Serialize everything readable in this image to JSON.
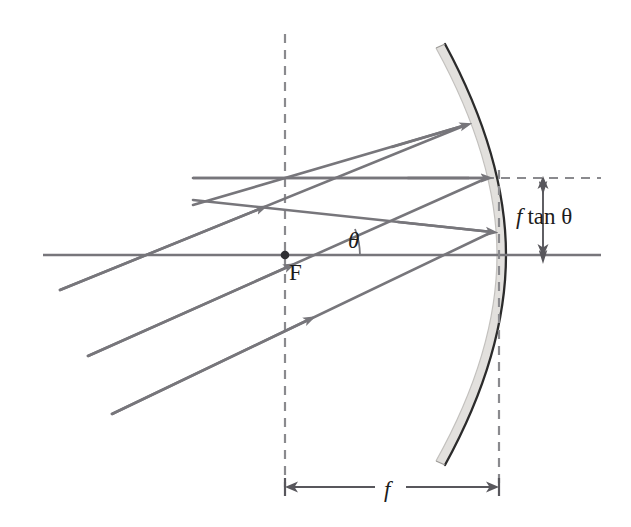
{
  "figure": {
    "type": "optics-ray-diagram",
    "canvas": {
      "width": 631,
      "height": 527,
      "background": "#ffffff"
    }
  },
  "labels": {
    "focus_point": "F",
    "angle": "θ",
    "height_prefix": "f",
    "height_expr": "tan θ",
    "focal_length": "f"
  },
  "colors": {
    "ray": "#77767b",
    "axis": "#77767b",
    "dashed": "#8a8a8e",
    "mirror_fill": "#e2e0dd",
    "mirror_front_edge": "#2b2b2b",
    "dimension": "#58575c",
    "text": "#1c1c1c",
    "background": "#ffffff"
  },
  "geometry": {
    "optical_axis": {
      "x1": 43,
      "y1": 255,
      "x2": 601,
      "y2": 255
    },
    "focal_plane_line": {
      "x1": 193,
      "y1": 178,
      "x2": 466,
      "y2": 178
    },
    "focal_plane_dashed": {
      "x1": 466,
      "y1": 178,
      "x2": 601,
      "y2": 178
    },
    "vertical_dashed_focus": {
      "x": 285,
      "y1": 34,
      "y2": 487
    },
    "vertical_dashed_vertex": {
      "x": 499,
      "y1": 168,
      "y2": 487
    },
    "focus_dot": {
      "x": 285,
      "y": 255,
      "r": 4.2
    },
    "convergence_point": {
      "x": 285,
      "y": 178
    },
    "mirror": {
      "vertex": {
        "x": 497,
        "y": 255
      },
      "top_end": {
        "x": 436,
        "y": 48
      },
      "bottom_end": {
        "x": 436,
        "y": 461
      },
      "thickness": 9,
      "curvature_radius": 430
    },
    "angle_arc": {
      "cx": 285,
      "cy": 255,
      "r": 70,
      "start_deg": 0,
      "end_deg": 19
    }
  },
  "rays": {
    "incident_tilt_degrees": 19,
    "incoming": [
      {
        "name": "incoming-ray-top",
        "x1": 60,
        "y1": 290,
        "x2": 466,
        "y2": 125,
        "arrow_at": 0.52
      },
      {
        "name": "incoming-ray-middle",
        "x1": 88,
        "y1": 356,
        "x2": 487,
        "y2": 178,
        "arrow_at": 0.52
      },
      {
        "name": "incoming-ray-bottom",
        "x1": 112,
        "y1": 414,
        "x2": 492,
        "y2": 232,
        "arrow_at": 0.52
      }
    ],
    "reflected": [
      {
        "name": "reflected-ray-top",
        "x1": 466,
        "y1": 125,
        "x2": 285,
        "y2": 178,
        "arrow_at": 0.52
      },
      {
        "name": "reflected-ray-middle",
        "x1": 487,
        "y1": 178,
        "x2": 285,
        "y2": 178,
        "arrow_at": 0.5
      },
      {
        "name": "reflected-ray-bottom",
        "x1": 492,
        "y1": 232,
        "x2": 285,
        "y2": 178,
        "arrow_at": 0.55
      }
    ],
    "extensions": [
      {
        "name": "ray-extension-top-left",
        "x1": 285,
        "y1": 178,
        "x2": 193,
        "y2": 205
      },
      {
        "name": "ray-extension-bottom-left",
        "x1": 285,
        "y1": 178,
        "x2": 193,
        "y2": 200
      }
    ]
  },
  "dimensions": {
    "focal_length": {
      "label": "f",
      "y": 487,
      "x_start": 285,
      "x_end": 499,
      "label_x": 392,
      "label_y": 495
    },
    "height": {
      "label_prefix": "f",
      "label_rest": "tan θ",
      "x": 543,
      "y_top": 178,
      "y_bottom": 255,
      "label_x": 516,
      "label_y": 224
    }
  }
}
